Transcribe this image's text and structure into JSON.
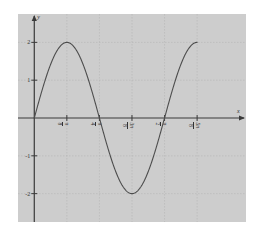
{
  "chart_data": {
    "type": "line",
    "title": "",
    "xlabel": "x",
    "ylabel": "y",
    "function": "y = 2 sin(4x)",
    "grid": true,
    "legend": null,
    "xlim": [
      -0.19634954,
      2.553
    ],
    "ylim": [
      -2.75,
      2.75
    ],
    "xticks": [
      {
        "value": 0.39269908,
        "label": "π/8",
        "num": "π",
        "den": "8"
      },
      {
        "value": 0.78539816,
        "label": "π/4",
        "num": "π",
        "den": "4"
      },
      {
        "value": 1.17809725,
        "label": "3π/8",
        "num": "3π",
        "den": "8"
      },
      {
        "value": 1.57079633,
        "label": "π/2",
        "num": "π",
        "den": "2"
      },
      {
        "value": 1.96349541,
        "label": "5π/8",
        "num": "5π",
        "den": "8"
      }
    ],
    "yticks": [
      {
        "value": 2,
        "label": "2"
      },
      {
        "value": 1,
        "label": "1"
      },
      {
        "value": -1,
        "label": "-1"
      },
      {
        "value": -2,
        "label": "-2"
      }
    ],
    "series": [
      {
        "name": "2 sin(4x)",
        "color": "#4d4d4d",
        "amplitude": 2,
        "frequency": 4,
        "x_start": 0,
        "x_end": 1.96349541,
        "points": [
          {
            "x": 0.0,
            "y": 0.0
          },
          {
            "x": 0.09817477,
            "y": 0.76536686
          },
          {
            "x": 0.19634954,
            "y": 1.41421356
          },
          {
            "x": 0.29452431,
            "y": 1.84775907
          },
          {
            "x": 0.39269908,
            "y": 2.0
          },
          {
            "x": 0.49087385,
            "y": 1.84775907
          },
          {
            "x": 0.58904862,
            "y": 1.41421356
          },
          {
            "x": 0.68722339,
            "y": 0.76536686
          },
          {
            "x": 0.78539816,
            "y": 0.0
          },
          {
            "x": 0.88357293,
            "y": -0.76536686
          },
          {
            "x": 0.9817477,
            "y": -1.41421356
          },
          {
            "x": 1.07992248,
            "y": -1.84775907
          },
          {
            "x": 1.17809725,
            "y": -2.0
          },
          {
            "x": 1.27627202,
            "y": -1.84775907
          },
          {
            "x": 1.37444679,
            "y": -1.41421356
          },
          {
            "x": 1.47262156,
            "y": -0.76536686
          },
          {
            "x": 1.57079633,
            "y": 0.0
          },
          {
            "x": 1.6689711,
            "y": 0.76536686
          },
          {
            "x": 1.76714587,
            "y": 1.41421356
          },
          {
            "x": 1.86532064,
            "y": 1.84775907
          },
          {
            "x": 1.96349541,
            "y": 2.0
          }
        ]
      }
    ],
    "colors": {
      "plot_background": "#cdcdcd",
      "page_background": "#ffffff",
      "grid": "#b0b0b0",
      "axis": "#3a3a3a",
      "curve": "#4d4d4d",
      "text": "#333333"
    }
  }
}
